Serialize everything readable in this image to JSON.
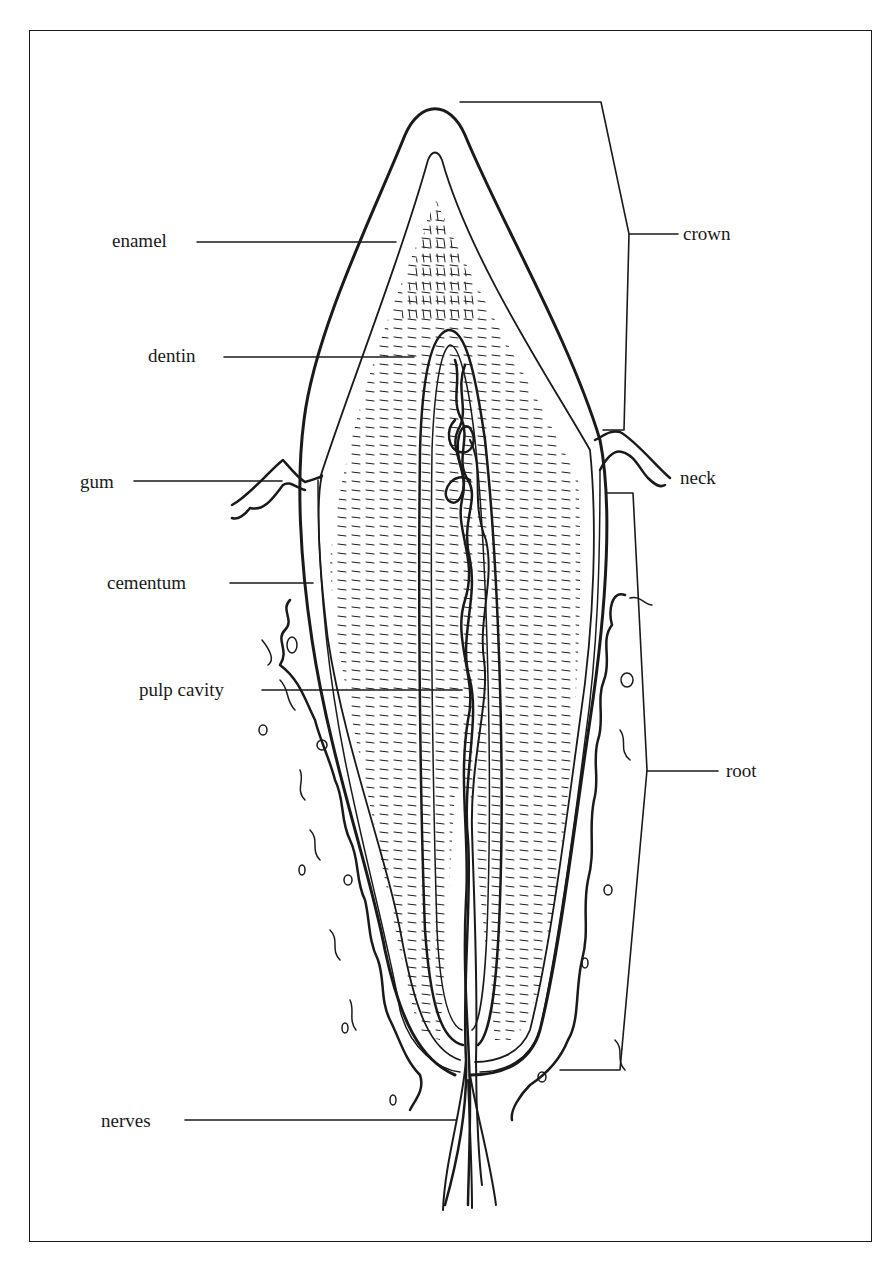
{
  "figure": {
    "labels": {
      "enamel": "enamel",
      "dentin": "dentin",
      "gum": "gum",
      "cementum": "cementum",
      "pulp_cavity": "pulp cavity",
      "nerves": "nerves",
      "crown": "crown",
      "neck": "neck",
      "root": "root"
    },
    "colors": {
      "line": "#1a1a1a",
      "background": "#ffffff"
    }
  }
}
